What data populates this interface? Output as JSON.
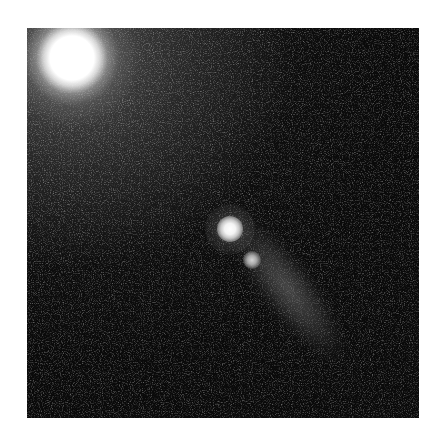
{
  "image": {
    "subject": "comet-like object with bright nucleus and diagonal tail against star field",
    "alt": "Grayscale astronomical image showing a bright saturated star in the upper-left corner and a comet with a bright nucleus, secondary knot, and faint tail extending toward the lower-right"
  },
  "features": {
    "bright_star": {
      "x": 72,
      "y": 58,
      "label": "bright-star"
    },
    "nucleus": {
      "x": 230,
      "y": 230,
      "label": "comet-nucleus"
    },
    "secondary_knot": {
      "x": 252,
      "y": 260,
      "label": "secondary-knot"
    },
    "tail_end": {
      "x": 340,
      "y": 355,
      "label": "comet-tail"
    }
  },
  "colors": {
    "background": "#0a0a0a",
    "glow": "#5a5a5a",
    "highlight": "#ffffff",
    "page": "#ffffff"
  }
}
